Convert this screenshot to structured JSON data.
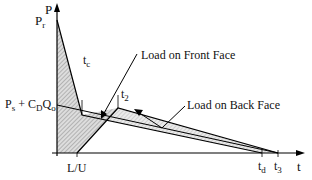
{
  "diagram": {
    "axis_y_label": "P",
    "axis_x_label": "t",
    "pr_main": "P",
    "pr_sub": "r",
    "ps_main": "P",
    "ps_sub": "s",
    "ps_plus": " + C",
    "cd_sub": "D",
    "q": "Q",
    "qo_sub": "o",
    "tc_main": "t",
    "tc_sub": "c",
    "t2_main": "t",
    "t2_sub": "2",
    "lu_label": "L/U",
    "td_main": "t",
    "td_sub": "d",
    "t3_main": "t",
    "t3_sub": "3",
    "front_label": "Load on Front Face",
    "back_label": "Load on Back Face"
  }
}
